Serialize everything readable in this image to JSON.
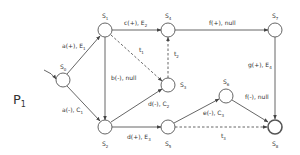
{
  "process_label": {
    "text": "P",
    "sub": "1"
  },
  "nodes": [
    {
      "id": "S0",
      "text": "S",
      "sub": "0",
      "x": 63,
      "y": 80
    },
    {
      "id": "S1",
      "text": "S",
      "sub": "1",
      "x": 105,
      "y": 30
    },
    {
      "id": "S2",
      "text": "S",
      "sub": "2",
      "x": 105,
      "y": 127
    },
    {
      "id": "S3",
      "text": "S",
      "sub": "3",
      "x": 168,
      "y": 85
    },
    {
      "id": "S4",
      "text": "S",
      "sub": "4",
      "x": 168,
      "y": 30
    },
    {
      "id": "S5",
      "text": "S",
      "sub": "5",
      "x": 168,
      "y": 127
    },
    {
      "id": "S6",
      "text": "S",
      "sub": "6",
      "x": 226,
      "y": 96
    },
    {
      "id": "S7",
      "text": "S",
      "sub": "7",
      "x": 275,
      "y": 30
    },
    {
      "id": "S8",
      "text": "S",
      "sub": "8",
      "x": 275,
      "y": 127,
      "final": true
    }
  ],
  "edges": [
    {
      "from": "S0",
      "to": "S1",
      "label": "a(+), E",
      "sub": "1"
    },
    {
      "from": "S0",
      "to": "S2",
      "label": "a(-), C",
      "sub": "1"
    },
    {
      "from": "S1",
      "to": "S4",
      "label": "c(+), E",
      "sub": "2"
    },
    {
      "from": "S1",
      "to": "S2",
      "label": "b(-), null"
    },
    {
      "from": "S1",
      "to": "S3",
      "label": "t",
      "sub": "1",
      "dashed": true
    },
    {
      "from": "S3",
      "to": "S4",
      "label": "t",
      "sub": "2",
      "dashed": true
    },
    {
      "from": "S2",
      "to": "S3",
      "label": "d(-), C",
      "sub": "2"
    },
    {
      "from": "S2",
      "to": "S5",
      "label": "d(+), E",
      "sub": "3"
    },
    {
      "from": "S4",
      "to": "S7",
      "label": "f(+), null"
    },
    {
      "from": "S7",
      "to": "S8",
      "label": "g(+), E",
      "sub": "4"
    },
    {
      "from": "S5",
      "to": "S6",
      "label": "e(-), C",
      "sub": "3"
    },
    {
      "from": "S6",
      "to": "S8",
      "label": "f(-), null"
    },
    {
      "from": "S5",
      "to": "S8",
      "label": "t",
      "sub": "3",
      "dashed": true
    }
  ]
}
